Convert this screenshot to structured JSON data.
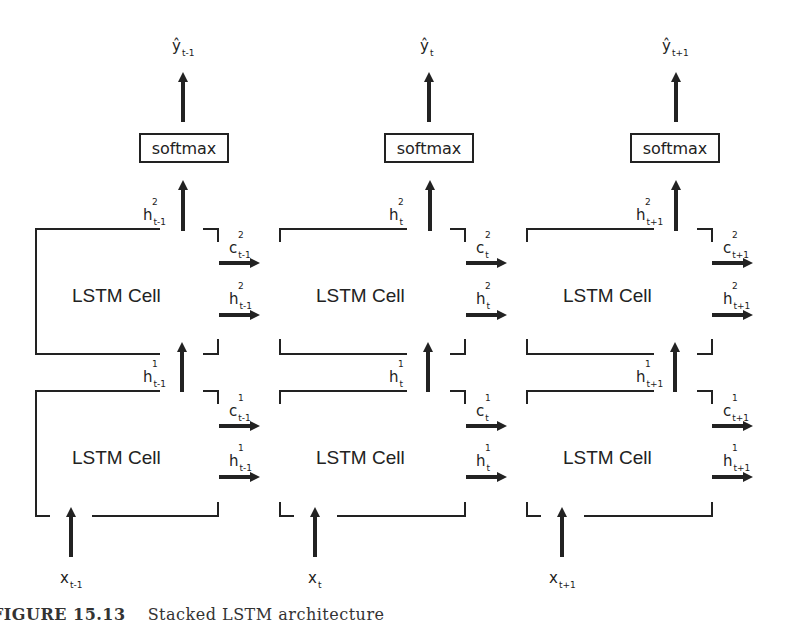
{
  "diagram": {
    "title": "Stacked LSTM architecture",
    "caption": {
      "figure_label": "FIGURE 15.13",
      "text": "Stacked LSTM architecture"
    },
    "timesteps": [
      {
        "index": "t-1",
        "output": {
          "label": "ŷ",
          "sub": "t-1"
        },
        "softmax": "softmax",
        "layer2": {
          "cell": "LSTM Cell",
          "h_out": {
            "label": "h",
            "sup": "2",
            "sub": "t-1"
          },
          "c_right": {
            "label": "c",
            "sup": "2",
            "sub": "t-1"
          },
          "h_right": {
            "label": "h",
            "sup": "2",
            "sub": "t-1"
          }
        },
        "layer1": {
          "cell": "LSTM Cell",
          "h_out": {
            "label": "h",
            "sup": "1",
            "sub": "t-1"
          },
          "c_right": {
            "label": "c",
            "sup": "1",
            "sub": "t-1"
          },
          "h_right": {
            "label": "h",
            "sup": "1",
            "sub": "t-1"
          }
        },
        "input": {
          "label": "x",
          "sub": "t-1"
        }
      },
      {
        "index": "t",
        "output": {
          "label": "ŷ",
          "sub": "t"
        },
        "softmax": "softmax",
        "layer2": {
          "cell": "LSTM Cell",
          "h_out": {
            "label": "h",
            "sup": "2",
            "sub": "t"
          },
          "c_right": {
            "label": "c",
            "sup": "2",
            "sub": "t"
          },
          "h_right": {
            "label": "h",
            "sup": "2",
            "sub": "t"
          }
        },
        "layer1": {
          "cell": "LSTM Cell",
          "h_out": {
            "label": "h",
            "sup": "1",
            "sub": "t"
          },
          "c_right": {
            "label": "c",
            "sup": "1",
            "sub": "t"
          },
          "h_right": {
            "label": "h",
            "sup": "1",
            "sub": "t"
          }
        },
        "input": {
          "label": "x",
          "sub": "t"
        }
      },
      {
        "index": "t+1",
        "output": {
          "label": "ŷ",
          "sub": "t+1"
        },
        "softmax": "softmax",
        "layer2": {
          "cell": "LSTM Cell",
          "h_out": {
            "label": "h",
            "sup": "2",
            "sub": "t+1"
          },
          "c_right": {
            "label": "c",
            "sup": "2",
            "sub": "t+1"
          },
          "h_right": {
            "label": "h",
            "sup": "2",
            "sub": "t+1"
          }
        },
        "layer1": {
          "cell": "LSTM Cell",
          "h_out": {
            "label": "h",
            "sup": "1",
            "sub": "t+1"
          },
          "c_right": {
            "label": "c",
            "sup": "1",
            "sub": "t+1"
          },
          "h_right": {
            "label": "h",
            "sup": "1",
            "sub": "t+1"
          }
        },
        "input": {
          "label": "x",
          "sub": "t+1"
        }
      }
    ],
    "colors": {
      "stroke": "#222222",
      "background": "#ffffff"
    }
  }
}
